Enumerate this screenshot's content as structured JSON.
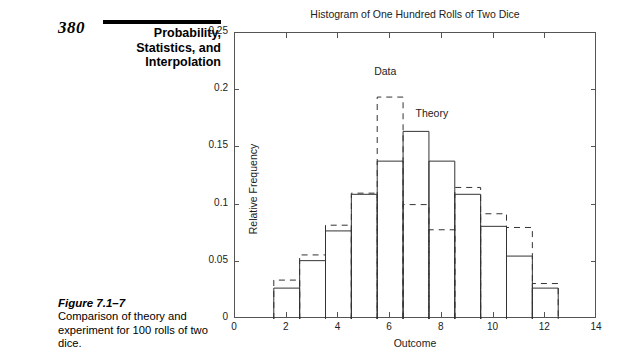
{
  "book": {
    "page_number": "380",
    "running_head_lines": [
      "Probability,",
      "Statistics, and",
      "Interpolation"
    ],
    "figure": {
      "title": "Figure 7.1–7",
      "caption": "Comparison of theory and experiment for 100 rolls of two dice."
    }
  },
  "chart_data": {
    "type": "bar",
    "title": "Histogram of One Hundred Rolls of Two Dice",
    "xlabel": "Outcome",
    "ylabel": "Relative Frequency",
    "xlim": [
      0,
      14
    ],
    "ylim": [
      0,
      0.25
    ],
    "xticks": [
      0,
      2,
      4,
      6,
      8,
      10,
      12,
      14
    ],
    "xtick_labels": [
      "0",
      "2",
      "4",
      "6",
      "8",
      "10",
      "12",
      "14"
    ],
    "yticks": [
      0,
      0.05,
      0.1,
      0.15,
      0.2,
      0.25
    ],
    "ytick_labels": [
      "0",
      "0.05",
      "0.1",
      "0.15",
      "0.2",
      "0.25"
    ],
    "grid": false,
    "legend": "inline-annotations",
    "categories": [
      2,
      3,
      4,
      5,
      6,
      7,
      8,
      9,
      10,
      11,
      12
    ],
    "series": [
      {
        "name": "Theory",
        "style": "solid",
        "color": "#333333",
        "values": [
          0.027,
          0.051,
          0.077,
          0.109,
          0.138,
          0.164,
          0.138,
          0.109,
          0.081,
          0.055,
          0.027
        ]
      },
      {
        "name": "Data",
        "style": "dashed",
        "color": "#333333",
        "values": [
          0.034,
          0.056,
          0.082,
          0.11,
          0.194,
          0.1,
          0.078,
          0.115,
          0.092,
          0.08,
          0.031
        ]
      }
    ],
    "annotations": [
      {
        "text": "Data",
        "x": 6,
        "y": 0.215
      },
      {
        "text": "Theory",
        "x": 7.6,
        "y": 0.178
      }
    ]
  }
}
